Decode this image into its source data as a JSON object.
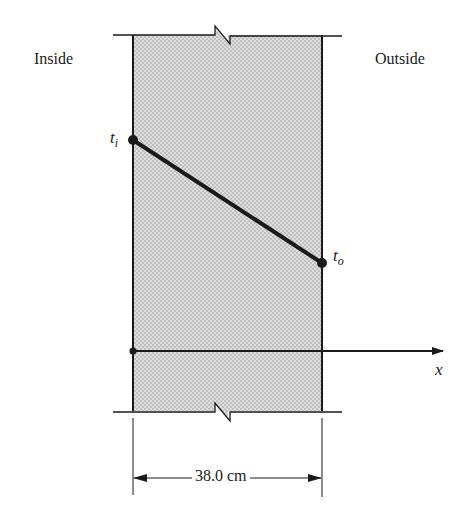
{
  "diagram": {
    "regions": {
      "inside_label": "Inside",
      "outside_label": "Outside"
    },
    "wall": {
      "fill_color": "#cfcfcf",
      "stroke_color": "#1a1a1a",
      "thickness_label": "38.0 cm",
      "has_break_marks": true
    },
    "temperature_points": {
      "inner": {
        "symbol": "t",
        "subscript": "i"
      },
      "outer": {
        "symbol": "t",
        "subscript": "o"
      }
    },
    "axis": {
      "label": "x"
    }
  }
}
